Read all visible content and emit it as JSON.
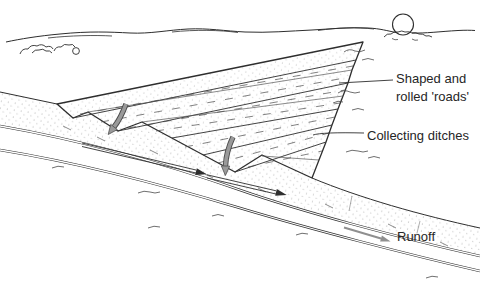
{
  "figure": {
    "labels": {
      "roads_line1": "Shaped and",
      "roads_line2": "rolled 'roads'",
      "ditches": "Collecting ditches",
      "runoff": "Runoff"
    }
  },
  "colors": {
    "ink": "#2e2e2e",
    "arrow_gray": "#8f8f8f",
    "background": "#ffffff"
  }
}
